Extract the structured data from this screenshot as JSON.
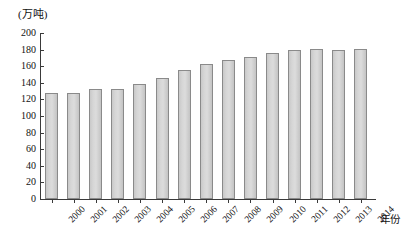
{
  "chart_data": {
    "type": "bar",
    "title": "",
    "subtitle": "",
    "unit_label": "(万吨)",
    "xlabel": "年份",
    "ylabel": "",
    "ylim": [
      0,
      200
    ],
    "y_ticks": [
      0,
      20,
      40,
      60,
      80,
      100,
      120,
      140,
      160,
      180,
      200
    ],
    "grid": false,
    "legend": null,
    "categories": [
      "2000",
      "2001",
      "2002",
      "2003",
      "2004",
      "2005",
      "2006",
      "2007",
      "2008",
      "2009",
      "2010",
      "2011",
      "2012",
      "2013",
      "2014"
    ],
    "values": [
      128,
      128,
      132,
      133,
      139,
      146,
      155,
      163,
      167,
      171,
      176,
      179,
      181,
      180,
      181
    ],
    "series": [
      {
        "name": "产量",
        "values": [
          128,
          128,
          132,
          133,
          139,
          146,
          155,
          163,
          167,
          171,
          176,
          179,
          181,
          180,
          181
        ]
      }
    ],
    "bar_color": "#d2d2d2",
    "bar_border_color": "#8a8a8a",
    "axis_color": "#3a3a3a"
  }
}
